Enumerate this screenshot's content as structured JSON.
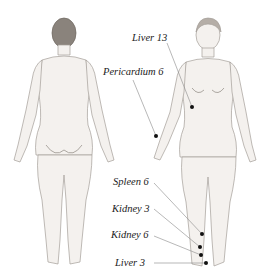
{
  "colors": {
    "skin": "#f4f1ee",
    "outline": "#9a9590",
    "hair": "#7a736d",
    "dot": "#111111",
    "line": "#888888",
    "text": "#222222"
  },
  "figures": [
    {
      "name": "back-view",
      "label": ""
    },
    {
      "name": "front-view",
      "label": ""
    }
  ],
  "points": [
    {
      "name": "Liver 13",
      "label": "Liver 13"
    },
    {
      "name": "Pericardium 6",
      "label": "Pericardium 6"
    },
    {
      "name": "Spleen 6",
      "label": "Spleen 6"
    },
    {
      "name": "Kidney 3",
      "label": "Kidney 3"
    },
    {
      "name": "Kidney 6",
      "label": "Kidney 6"
    },
    {
      "name": "Liver 3",
      "label": "Liver 3"
    }
  ]
}
